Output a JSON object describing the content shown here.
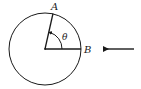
{
  "diagram": {
    "labels": {
      "point_a": "A",
      "point_b": "B",
      "angle": "θ"
    },
    "colors": {
      "stroke": "#1a1a1a",
      "background": "#ffffff"
    },
    "elements": [
      "circle",
      "radius-to-A",
      "radius-to-B",
      "angle-arc-theta",
      "incoming-arrow-left"
    ]
  }
}
